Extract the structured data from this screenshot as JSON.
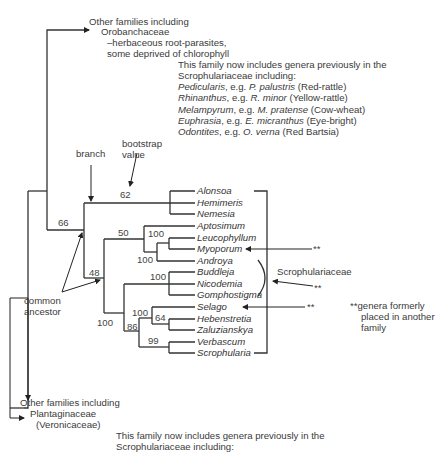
{
  "top_group": {
    "line1": "Other families including",
    "line2": "Orobanchaceae",
    "line3": "–herbaceous root-parasites,",
    "line4": "some deprived of chlorophyll"
  },
  "top_note": {
    "intro1": "This family now includes genera previously in the",
    "intro2": "Scrophulariaceae including:",
    "examples": [
      {
        "genus": "Pedicularis",
        "mid": ", e.g. ",
        "species": "P. palustris",
        "common": " (Red-rattle)"
      },
      {
        "genus": "Rhinanthus",
        "mid": ", e.g. ",
        "species": "R. minor",
        "common": " (Yellow-rattle)"
      },
      {
        "genus": "Melampyrum",
        "mid": ", e.g. ",
        "species": "M. pratense",
        "common": " (Cow-wheat)"
      },
      {
        "genus": "Euphrasia",
        "mid": ", e.g. ",
        "species": "E. micranthus",
        "common": " (Eye-bright)"
      },
      {
        "genus": "Odontites",
        "mid": ", e.g. ",
        "species": "O. verna",
        "common": " (Red Bartsia)"
      }
    ]
  },
  "annotations": {
    "branch": "branch",
    "bootstrap1": "bootstrap",
    "bootstrap2": "value",
    "common1": "common",
    "common2": "ancestor",
    "family_bracket": "Scrophulariaceae",
    "marker": "**",
    "footnote_marker": "**",
    "footnote1": "genera formerly",
    "footnote2": "placed in another",
    "footnote3": "family"
  },
  "taxa": [
    "Alonsoa",
    "Hemimeris",
    "Nemesia",
    "Aptosimum",
    "Leucophyllum",
    "Myoporum",
    "Androya",
    "Buddleja",
    "Nicodemia",
    "Gomphostigma",
    "Selago",
    "Hebenstretia",
    "Zaluzianskya",
    "Verbascum",
    "Scrophularia"
  ],
  "bootstrap_values": {
    "b66": "66",
    "b62": "62",
    "b48": "48",
    "b50": "50",
    "b100_leuco_myo": "100",
    "b100_androya": "100",
    "b100_buddleja": "100",
    "b100_lower": "100",
    "b100_selago": "100",
    "b64": "64",
    "b86": "86",
    "b99": "99"
  },
  "bottom_group": {
    "line1": "Other families including",
    "line2": "Plantaginaceae",
    "line3": "(Veronicaceae)"
  },
  "bottom_note": {
    "line1": "This family now includes genera previously in the",
    "line2": "Scrophulariaceae including:"
  },
  "colors": {
    "line": "#333333",
    "text": "#3a3a3a",
    "background": "#ffffff"
  }
}
